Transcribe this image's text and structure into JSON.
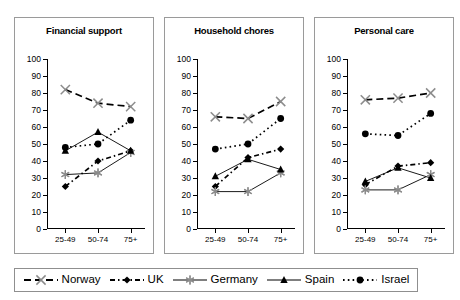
{
  "chart_data": {
    "type": "line",
    "title": "",
    "panels": [
      {
        "title": "Financial support",
        "categories": [
          "25-49",
          "50-74",
          "75+"
        ],
        "series": [
          {
            "name": "Norway",
            "values": [
              82,
              74,
              72
            ]
          },
          {
            "name": "UK",
            "values": [
              25,
              40,
              46
            ]
          },
          {
            "name": "Germany",
            "values": [
              32,
              33,
              45
            ]
          },
          {
            "name": "Spain",
            "values": [
              46,
              57,
              46
            ]
          },
          {
            "name": "Israel",
            "values": [
              48,
              50,
              64
            ]
          }
        ]
      },
      {
        "title": "Household chores",
        "categories": [
          "25-49",
          "50-74",
          "75+"
        ],
        "series": [
          {
            "name": "Norway",
            "values": [
              66,
              65,
              75
            ]
          },
          {
            "name": "UK",
            "values": [
              25,
              42,
              47
            ]
          },
          {
            "name": "Germany",
            "values": [
              22,
              22,
              33
            ]
          },
          {
            "name": "Spain",
            "values": [
              31,
              41,
              35
            ]
          },
          {
            "name": "Israel",
            "values": [
              47,
              50,
              65
            ]
          }
        ]
      },
      {
        "title": "Personal care",
        "categories": [
          "25-49",
          "50-74",
          "75+"
        ],
        "series": [
          {
            "name": "Norway",
            "values": [
              76,
              77,
              80
            ]
          },
          {
            "name": "UK",
            "values": [
              26,
              37,
              39
            ]
          },
          {
            "name": "Germany",
            "values": [
              23,
              23,
              32
            ]
          },
          {
            "name": "Spain",
            "values": [
              28,
              36,
              30
            ]
          },
          {
            "name": "Israel",
            "values": [
              56,
              55,
              68
            ]
          }
        ]
      }
    ],
    "xlabel": "",
    "ylabel": "",
    "ylim": [
      0,
      100
    ],
    "yticks": [
      0,
      10,
      20,
      30,
      40,
      50,
      60,
      70,
      80,
      90,
      100
    ],
    "grid": false,
    "legend_position": "bottom",
    "series_style": [
      {
        "name": "Norway",
        "marker": "cross-x-icon",
        "line": "dashed",
        "color": "#000000"
      },
      {
        "name": "UK",
        "marker": "diamond-icon",
        "line": "dashdot",
        "color": "#000000"
      },
      {
        "name": "Germany",
        "marker": "asterisk-icon",
        "line": "solid",
        "color": "#000000"
      },
      {
        "name": "Spain",
        "marker": "triangle-icon",
        "line": "solid",
        "color": "#000000"
      },
      {
        "name": "Israel",
        "marker": "circle-icon",
        "line": "dotted",
        "color": "#000000"
      }
    ]
  },
  "legend": {
    "entries": [
      {
        "label": "Norway"
      },
      {
        "label": "UK"
      },
      {
        "label": "Germany"
      },
      {
        "label": "Spain"
      },
      {
        "label": "Israel"
      }
    ]
  }
}
